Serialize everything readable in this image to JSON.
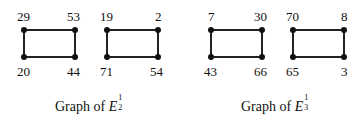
{
  "graphs": [
    {
      "id": "E2-a",
      "top_left": "29",
      "top_right": "53",
      "bottom_left": "20",
      "bottom_right": "44"
    },
    {
      "id": "E2-b",
      "top_left": "19",
      "top_right": "2",
      "bottom_left": "71",
      "bottom_right": "54"
    },
    {
      "id": "E3-a",
      "top_left": "7",
      "top_right": "30",
      "bottom_left": "43",
      "bottom_right": "66"
    },
    {
      "id": "E3-b",
      "top_left": "70",
      "top_right": "8",
      "bottom_left": "65",
      "bottom_right": "3"
    }
  ],
  "captions": [
    {
      "prefix": "Graph of ",
      "symbol": "E",
      "superscript": "1",
      "subscript": "2"
    },
    {
      "prefix": "Graph of ",
      "symbol": "E",
      "superscript": "1",
      "subscript": "3"
    }
  ]
}
